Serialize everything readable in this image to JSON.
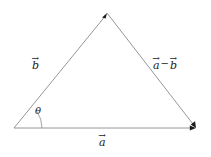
{
  "figure": {
    "background_color": "#ffffff",
    "line_color": "#8a8a8a",
    "text_color": "#222222",
    "width": 211,
    "height": 157
  },
  "vectors": [
    {
      "id": "b",
      "symbol": "b",
      "arrow_glyph": "→",
      "label_text": "b",
      "from": [
        14,
        128
      ],
      "to": [
        107,
        13
      ],
      "label_pos": [
        32,
        56
      ]
    },
    {
      "id": "a",
      "symbol": "a",
      "arrow_glyph": "→",
      "label_text": "a",
      "from": [
        14,
        128
      ],
      "to": [
        196,
        128
      ],
      "label_pos": [
        99,
        133
      ]
    },
    {
      "id": "a-minus-b",
      "symbol": "a",
      "symbol2": "b",
      "operator": "−",
      "arrow_glyph": "→",
      "label_text": "a − b",
      "from": [
        107,
        13
      ],
      "to": [
        196,
        128
      ],
      "label_pos": [
        153,
        56
      ]
    }
  ],
  "angle": {
    "id": "theta",
    "label": "θ",
    "vertex": [
      14,
      128
    ],
    "label_pos": [
      35,
      106
    ],
    "between": [
      "a",
      "b"
    ]
  }
}
